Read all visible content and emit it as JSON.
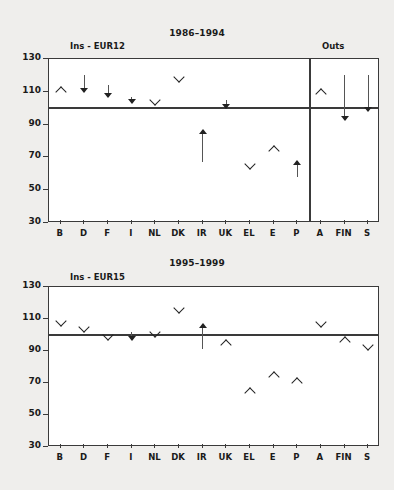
{
  "figure": {
    "y_axis_ticks": [
      130,
      110,
      90,
      70,
      50,
      30
    ],
    "reference_value": 100,
    "categories_in": [
      "B",
      "D",
      "F",
      "I",
      "NL",
      "DK",
      "IR",
      "UK",
      "EL",
      "E",
      "P"
    ],
    "categories_out": [
      "A",
      "FIN",
      "S"
    ]
  },
  "chart_data": [
    {
      "type": "scatter",
      "title": "1986–1994",
      "group_label_left": "Ins - EUR12",
      "group_label_right": "Outs",
      "xlabel": "",
      "ylabel": "",
      "ylim": [
        30,
        130
      ],
      "yticks": [
        130,
        110,
        90,
        70,
        50,
        30
      ],
      "reference_line": 100,
      "grid": false,
      "legend": "none",
      "categories": [
        "B",
        "D",
        "F",
        "I",
        "NL",
        "DK",
        "IR",
        "UK",
        "EL",
        "E",
        "P",
        "A",
        "FIN",
        "S"
      ],
      "group_split_after": "P",
      "points": [
        {
          "category": "B",
          "value": 111,
          "marker": "chevron-up",
          "from": null,
          "to": null
        },
        {
          "category": "D",
          "value": 110,
          "marker": "arrow-down",
          "from": 120,
          "to": 110
        },
        {
          "category": "F",
          "value": 107,
          "marker": "arrow-down",
          "from": 114,
          "to": 107
        },
        {
          "category": "I",
          "value": 103,
          "marker": "arrow-down",
          "from": 107,
          "to": 103
        },
        {
          "category": "NL",
          "value": 105,
          "marker": "chevron-down",
          "from": null,
          "to": null
        },
        {
          "category": "DK",
          "value": 119,
          "marker": "chevron-down",
          "from": null,
          "to": null
        },
        {
          "category": "IR",
          "value": 87,
          "marker": "arrow-up",
          "from": 67,
          "to": 87
        },
        {
          "category": "UK",
          "value": 100,
          "marker": "arrow-down",
          "from": 105,
          "to": 100
        },
        {
          "category": "EL",
          "value": 66,
          "marker": "chevron-down",
          "from": null,
          "to": null
        },
        {
          "category": "E",
          "value": 75,
          "marker": "chevron-up",
          "from": null,
          "to": null
        },
        {
          "category": "P",
          "value": 68,
          "marker": "arrow-up",
          "from": 58,
          "to": 68
        },
        {
          "category": "A",
          "value": 110,
          "marker": "chevron-up",
          "from": null,
          "to": null
        },
        {
          "category": "FIN",
          "value": 93,
          "marker": "arrow-down",
          "from": 120,
          "to": 93
        },
        {
          "category": "S",
          "value": 98,
          "marker": "arrow-down",
          "from": 120,
          "to": 98
        }
      ]
    },
    {
      "type": "scatter",
      "title": "1995–1999",
      "group_label_left": "Ins - EUR15",
      "group_label_right": "",
      "xlabel": "",
      "ylabel": "",
      "ylim": [
        30,
        130
      ],
      "yticks": [
        130,
        110,
        90,
        70,
        50,
        30
      ],
      "reference_line": 100,
      "grid": false,
      "legend": "none",
      "categories": [
        "B",
        "D",
        "F",
        "I",
        "NL",
        "DK",
        "IR",
        "UK",
        "EL",
        "E",
        "P",
        "A",
        "FIN",
        "S"
      ],
      "group_split_after": null,
      "points": [
        {
          "category": "B",
          "value": 109,
          "marker": "chevron-down",
          "from": null,
          "to": null
        },
        {
          "category": "D",
          "value": 105,
          "marker": "chevron-down",
          "from": null,
          "to": null
        },
        {
          "category": "F",
          "value": 100,
          "marker": "chevron-down",
          "from": null,
          "to": null
        },
        {
          "category": "I",
          "value": 97,
          "marker": "arrow-down",
          "from": 102,
          "to": 97
        },
        {
          "category": "NL",
          "value": 102,
          "marker": "chevron-down",
          "from": null,
          "to": null
        },
        {
          "category": "DK",
          "value": 117,
          "marker": "chevron-down",
          "from": null,
          "to": null
        },
        {
          "category": "IR",
          "value": 107,
          "marker": "arrow-up",
          "from": 91,
          "to": 107
        },
        {
          "category": "UK",
          "value": 95,
          "marker": "chevron-up",
          "from": null,
          "to": null
        },
        {
          "category": "EL",
          "value": 65,
          "marker": "chevron-up",
          "from": null,
          "to": null
        },
        {
          "category": "E",
          "value": 75,
          "marker": "chevron-up",
          "from": null,
          "to": null
        },
        {
          "category": "P",
          "value": 71,
          "marker": "chevron-up",
          "from": null,
          "to": null
        },
        {
          "category": "A",
          "value": 108,
          "marker": "chevron-down",
          "from": null,
          "to": null
        },
        {
          "category": "FIN",
          "value": 97,
          "marker": "chevron-up",
          "from": null,
          "to": null
        },
        {
          "category": "S",
          "value": 94,
          "marker": "chevron-down",
          "from": null,
          "to": null
        }
      ]
    }
  ]
}
